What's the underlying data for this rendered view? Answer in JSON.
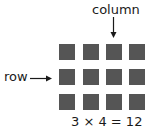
{
  "labels": {
    "column": "column",
    "row": "row",
    "equation": "3 × 4 = 12"
  },
  "grid": {
    "rows": 3,
    "columns": 4,
    "square_color": "#555555"
  },
  "arrows": {
    "column_arrow": "down-arrow",
    "row_arrow": "right-arrow"
  }
}
